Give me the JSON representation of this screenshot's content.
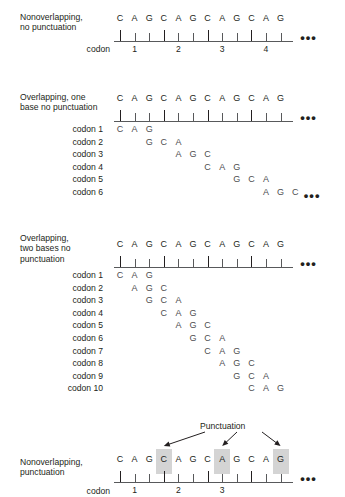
{
  "figure": {
    "bases": [
      "C",
      "A",
      "G"
    ],
    "full_sequence": [
      "C",
      "A",
      "G",
      "C",
      "A",
      "G",
      "C",
      "A",
      "G",
      "C",
      "A",
      "G"
    ],
    "ellipsis": "•••",
    "colors": {
      "text": "#231f20",
      "base_letter": "#4d4d4f",
      "line": "#58595b",
      "highlight": "#d4d4d4"
    }
  },
  "panels": [
    {
      "id": "nonoverlapping-no-punctuation",
      "title": "Nonoverlapping,\nno punctuation",
      "codon_word": "codon",
      "top_sequence": [
        "C",
        "A",
        "G",
        "C",
        "A",
        "G",
        "C",
        "A",
        "G",
        "C",
        "A",
        "G"
      ],
      "codon_numbers": [
        "1",
        "2",
        "3",
        "4"
      ],
      "rows": []
    },
    {
      "id": "overlapping-one-base",
      "title": "Overlapping, one\nbase no punctuation",
      "codon_word": "",
      "top_sequence": [
        "C",
        "A",
        "G",
        "C",
        "A",
        "G",
        "C",
        "A",
        "G",
        "C",
        "A",
        "G"
      ],
      "codon_numbers": [],
      "rows": [
        {
          "label": "codon 1",
          "offset": 0,
          "bases": [
            "C",
            "A",
            "G"
          ],
          "trailing_dots": false
        },
        {
          "label": "codon 2",
          "offset": 2,
          "bases": [
            "G",
            "C",
            "A"
          ],
          "trailing_dots": false
        },
        {
          "label": "codon 3",
          "offset": 4,
          "bases": [
            "A",
            "G",
            "C"
          ],
          "trailing_dots": false
        },
        {
          "label": "codon 4",
          "offset": 6,
          "bases": [
            "C",
            "A",
            "G"
          ],
          "trailing_dots": false
        },
        {
          "label": "codon 5",
          "offset": 8,
          "bases": [
            "G",
            "C",
            "A"
          ],
          "trailing_dots": false
        },
        {
          "label": "codon 6",
          "offset": 10,
          "bases": [
            "A",
            "G",
            "C"
          ],
          "trailing_dots": true
        }
      ]
    },
    {
      "id": "overlapping-two-bases",
      "title": "Overlapping,\ntwo bases no\npunctuation",
      "codon_word": "",
      "top_sequence": [
        "C",
        "A",
        "G",
        "C",
        "A",
        "G",
        "C",
        "A",
        "G",
        "C",
        "A",
        "G"
      ],
      "codon_numbers": [],
      "rows": [
        {
          "label": "codon 1",
          "offset": 0,
          "bases": [
            "C",
            "A",
            "G"
          ],
          "trailing_dots": false
        },
        {
          "label": "codon 2",
          "offset": 1,
          "bases": [
            "A",
            "G",
            "C"
          ],
          "trailing_dots": false
        },
        {
          "label": "codon 3",
          "offset": 2,
          "bases": [
            "G",
            "C",
            "A"
          ],
          "trailing_dots": false
        },
        {
          "label": "codon 4",
          "offset": 3,
          "bases": [
            "C",
            "A",
            "G"
          ],
          "trailing_dots": false
        },
        {
          "label": "codon 5",
          "offset": 4,
          "bases": [
            "A",
            "G",
            "C"
          ],
          "trailing_dots": false
        },
        {
          "label": "codon 6",
          "offset": 5,
          "bases": [
            "G",
            "C",
            "A"
          ],
          "trailing_dots": false
        },
        {
          "label": "codon 7",
          "offset": 6,
          "bases": [
            "C",
            "A",
            "G"
          ],
          "trailing_dots": false
        },
        {
          "label": "codon 8",
          "offset": 7,
          "bases": [
            "A",
            "G",
            "C"
          ],
          "trailing_dots": false
        },
        {
          "label": "codon 9",
          "offset": 8,
          "bases": [
            "G",
            "C",
            "A"
          ],
          "trailing_dots": false
        },
        {
          "label": "codon 10",
          "offset": 9,
          "bases": [
            "C",
            "A",
            "G"
          ],
          "trailing_dots": false
        }
      ]
    },
    {
      "id": "nonoverlapping-punctuation",
      "title": "Nonoverlapping,\npunctuation",
      "codon_word": "codon",
      "top_sequence": [
        "C",
        "A",
        "G",
        "C",
        "A",
        "G",
        "C",
        "A",
        "G",
        "C",
        "A",
        "G"
      ],
      "codon_numbers": [
        "1",
        "2",
        "3"
      ],
      "punctuation_label": "Punctuation",
      "punctuation_indices": [
        3,
        7,
        11
      ],
      "rows": []
    }
  ]
}
